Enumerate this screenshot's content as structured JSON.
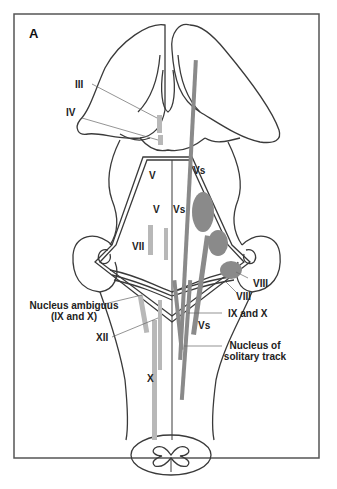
{
  "figure": {
    "panel_label": "A",
    "colors": {
      "outline": "#3a3a3a",
      "frame": "#555555",
      "motor_nucleus": "#b8b8b8",
      "sensory_nucleus": "#8a8a8a",
      "background": "#ffffff"
    },
    "labels": [
      {
        "id": "III",
        "text": "III"
      },
      {
        "id": "IV",
        "text": "IV"
      },
      {
        "id": "V_upper",
        "text": "V"
      },
      {
        "id": "Vs_upper",
        "text": "Vs"
      },
      {
        "id": "V_mid",
        "text": "V"
      },
      {
        "id": "Vs_mid",
        "text": "Vs"
      },
      {
        "id": "VII",
        "text": "VII"
      },
      {
        "id": "VIII_a",
        "text": "VIII"
      },
      {
        "id": "VIII_b",
        "text": "VIII"
      },
      {
        "id": "nucleus_ambiguus_1",
        "text": "Nucleus ambiguus"
      },
      {
        "id": "nucleus_ambiguus_2",
        "text": "(IX and X)"
      },
      {
        "id": "IX_X",
        "text": "IX and X"
      },
      {
        "id": "Vs_lower",
        "text": "Vs"
      },
      {
        "id": "XII",
        "text": "XII"
      },
      {
        "id": "solitary_1",
        "text": "Nucleus of"
      },
      {
        "id": "solitary_2",
        "text": "solitary track"
      },
      {
        "id": "X",
        "text": "X"
      }
    ]
  }
}
